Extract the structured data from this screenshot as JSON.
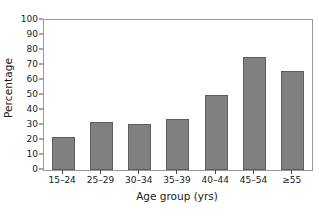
{
  "chart_data": {
    "type": "bar",
    "title": "",
    "subtitle": "",
    "xlabel": "Age group (yrs)",
    "ylabel": "Percentage",
    "categories": [
      "15–24",
      "25–29",
      "30–34",
      "35–39",
      "40–44",
      "45–54",
      "≥55"
    ],
    "values": [
      22,
      32,
      30.5,
      34,
      50,
      75.5,
      66
    ],
    "ylim": [
      0,
      100
    ],
    "yticks": [
      0,
      10,
      20,
      30,
      40,
      50,
      60,
      70,
      80,
      90,
      100
    ],
    "ytick_labels": [
      "0",
      "10",
      "20",
      "30",
      "40",
      "50",
      "60",
      "70",
      "80",
      "90",
      "100"
    ],
    "grid": false,
    "legend": null,
    "legend_position": "none",
    "series": [
      {
        "name": "Percentage",
        "values": [
          22,
          32,
          30.5,
          34,
          50,
          75.5,
          66
        ]
      }
    ],
    "colors": {
      "bar_fill": "#808080",
      "bar_edge": "#5e5e5e",
      "axis": "#9a9a9a",
      "tick": "#4d4d4d",
      "text": "#1a1a1a",
      "background": "#ffffff"
    }
  }
}
